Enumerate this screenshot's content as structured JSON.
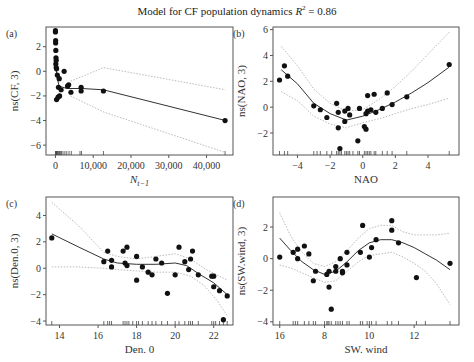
{
  "title": {
    "text": "Model for CF population dynamics",
    "r2_label": "R",
    "r2_sup": "2",
    "r2_value": " = 0.86"
  },
  "chart_data": [
    {
      "panel": "(a)",
      "type": "scatter",
      "xlabel": "N_{t-1}",
      "ylabel": "ns(CF, 3)",
      "xticks": [
        0,
        10000,
        20000,
        30000,
        40000
      ],
      "xtick_labels": [
        "0",
        "10,000",
        "20,000",
        "30,000",
        "40,000"
      ],
      "yticks": [
        2,
        0,
        -2,
        -4,
        -6
      ],
      "xlim": [
        -2500,
        47000
      ],
      "ylim": [
        -6.8,
        3.6
      ],
      "points": [
        [
          0,
          3.3
        ],
        [
          0,
          3.2
        ],
        [
          50,
          2.5
        ],
        [
          50,
          2.3
        ],
        [
          100,
          1.7
        ],
        [
          150,
          1.1
        ],
        [
          200,
          0.9
        ],
        [
          100,
          0.6
        ],
        [
          200,
          0.3
        ],
        [
          300,
          0.2
        ],
        [
          500,
          -0.3
        ],
        [
          2300,
          0
        ],
        [
          1000,
          -0.6
        ],
        [
          800,
          -1.3
        ],
        [
          1500,
          -1.5
        ],
        [
          300,
          -2.3
        ],
        [
          700,
          -2.1
        ],
        [
          1100,
          -2
        ],
        [
          3200,
          -1.2
        ],
        [
          3500,
          -1.1
        ],
        [
          4100,
          -1.7
        ],
        [
          6800,
          -1.3
        ],
        [
          6800,
          -1.6
        ],
        [
          12700,
          -1.6
        ],
        [
          44900,
          -4
        ]
      ],
      "fit": [
        [
          0,
          0.8
        ],
        [
          400,
          -0.5
        ],
        [
          1000,
          -1.2
        ],
        [
          3000,
          -1.4
        ],
        [
          7000,
          -1.4
        ],
        [
          12700,
          -1.5
        ],
        [
          45000,
          -4
        ]
      ],
      "ci_upper": [
        [
          4000,
          -0.8
        ],
        [
          8000,
          -0.3
        ],
        [
          12700,
          0.3
        ],
        [
          45000,
          -1.5
        ]
      ],
      "ci_lower": [
        [
          4000,
          -2
        ],
        [
          8000,
          -2.6
        ],
        [
          12700,
          -3.3
        ],
        [
          45000,
          -6.6
        ]
      ],
      "rug": [
        0,
        100,
        200,
        300,
        400,
        500,
        700,
        900,
        1100,
        1300,
        1600,
        2000,
        2500,
        3000,
        3600,
        4200,
        6500,
        6900,
        12700,
        44900
      ]
    },
    {
      "panel": "(b)",
      "type": "scatter",
      "xlabel": "NAO",
      "ylabel": "ns(NAO, 3)",
      "xticks": [
        -4,
        -2,
        0,
        2,
        4
      ],
      "xtick_labels": [
        "−4",
        "−2",
        "0",
        "2",
        "4"
      ],
      "yticks": [
        6,
        4,
        2,
        0,
        -2
      ],
      "ytick_labels": [
        "6",
        "4",
        "2",
        "0",
        "−2"
      ],
      "xlim": [
        -5.5,
        5.9
      ],
      "ylim": [
        -3.7,
        6.2
      ],
      "points": [
        [
          -5.1,
          2.1
        ],
        [
          -4.8,
          3.2
        ],
        [
          -4.6,
          2.4
        ],
        [
          -3,
          0.1
        ],
        [
          -2.6,
          -0.2
        ],
        [
          -2.2,
          -0.8
        ],
        [
          -1.6,
          0.3
        ],
        [
          -1.5,
          -0.4
        ],
        [
          -1.5,
          -1.6
        ],
        [
          -1.1,
          -1.1
        ],
        [
          -1.1,
          -0.3
        ],
        [
          -0.9,
          -0.1
        ],
        [
          -0.8,
          -0.6
        ],
        [
          -1.4,
          -3.2
        ],
        [
          -0.3,
          -2.6
        ],
        [
          -0.2,
          -0.1
        ],
        [
          0.1,
          -1.5
        ],
        [
          0.2,
          -1.7
        ],
        [
          0.3,
          -0.3
        ],
        [
          0.2,
          -0.5
        ],
        [
          0.3,
          0.9
        ],
        [
          0.5,
          -0.2
        ],
        [
          0.7,
          1
        ],
        [
          0.8,
          -0.4
        ],
        [
          1.2,
          -0.1
        ],
        [
          1.5,
          1.1
        ],
        [
          1.8,
          0.2
        ],
        [
          2.7,
          0.8
        ],
        [
          5.3,
          3.3
        ]
      ],
      "fit": [
        [
          -5,
          2.9
        ],
        [
          -4,
          1.8
        ],
        [
          -3,
          0.3
        ],
        [
          -2,
          -0.5
        ],
        [
          -1,
          -1
        ],
        [
          0,
          -0.7
        ],
        [
          1,
          -0.2
        ],
        [
          2,
          0.4
        ],
        [
          3,
          1.1
        ],
        [
          4,
          1.9
        ],
        [
          5.3,
          3.1
        ]
      ],
      "ci_upper": [
        [
          -5,
          4.7
        ],
        [
          -4,
          3.2
        ],
        [
          -3,
          1.4
        ],
        [
          -2,
          0.3
        ],
        [
          -1,
          -0.3
        ],
        [
          0,
          -0.2
        ],
        [
          1,
          0.6
        ],
        [
          2,
          1.6
        ],
        [
          3,
          2.8
        ],
        [
          4,
          4.1
        ],
        [
          5.3,
          5.8
        ]
      ],
      "ci_lower": [
        [
          -5,
          1.2
        ],
        [
          -4,
          0.5
        ],
        [
          -3,
          -0.7
        ],
        [
          -2,
          -1.3
        ],
        [
          -1,
          -1.6
        ],
        [
          0,
          -1.2
        ],
        [
          1,
          -0.9
        ],
        [
          2,
          -0.5
        ],
        [
          3,
          -0.1
        ],
        [
          4,
          0.2
        ],
        [
          5.3,
          0.7
        ]
      ],
      "rug": [
        -5.1,
        -4.8,
        -4.6,
        -3,
        -2.8,
        -2.6,
        -2.2,
        -1.9,
        -1.6,
        -1.5,
        -1.4,
        -1.3,
        -1.1,
        -1,
        -0.9,
        -0.8,
        -0.6,
        -0.3,
        -0.2,
        0.1,
        0.2,
        0.3,
        0.4,
        0.5,
        0.7,
        0.8,
        1.2,
        1.5,
        1.8,
        2.7,
        5.3
      ]
    },
    {
      "panel": "(c)",
      "type": "scatter",
      "xlabel": "Den. 0",
      "ylabel": "ns(Den.0, 3)",
      "xticks": [
        14,
        16,
        18,
        20,
        22
      ],
      "xtick_labels": [
        "14",
        "16",
        "18",
        "20",
        "22"
      ],
      "yticks": [
        4,
        2,
        0,
        -2,
        -4
      ],
      "ytick_labels": [
        "4",
        "2",
        "0",
        "−2",
        "−4"
      ],
      "xlim": [
        13.3,
        23
      ],
      "ylim": [
        -4.3,
        5.4
      ],
      "points": [
        [
          13.6,
          2.3
        ],
        [
          16.3,
          0.5
        ],
        [
          16.5,
          1.3
        ],
        [
          16.7,
          0.6
        ],
        [
          16.7,
          0.1
        ],
        [
          17.3,
          1.3
        ],
        [
          17.4,
          0.4
        ],
        [
          17.5,
          1.6
        ],
        [
          17.5,
          0.2
        ],
        [
          18,
          0.9
        ],
        [
          18,
          -0.9
        ],
        [
          18.3,
          0.1
        ],
        [
          18.6,
          -0.3
        ],
        [
          18.8,
          -0.5
        ],
        [
          19,
          0.7
        ],
        [
          19.3,
          0.4
        ],
        [
          19.6,
          -1.9
        ],
        [
          20,
          -0.5
        ],
        [
          20.2,
          1.6
        ],
        [
          20.5,
          0.5
        ],
        [
          20.7,
          -0.1
        ],
        [
          20.8,
          0.7
        ],
        [
          20.9,
          1.3
        ],
        [
          21.2,
          -0.5
        ],
        [
          21.9,
          -0.6
        ],
        [
          22,
          -0.6
        ],
        [
          22,
          -1.4
        ],
        [
          22.3,
          -1.7
        ],
        [
          22.5,
          -3.9
        ],
        [
          22.7,
          -2.1
        ]
      ],
      "fit": [
        [
          13.6,
          2.6
        ],
        [
          15,
          1.6
        ],
        [
          16.3,
          0.7
        ],
        [
          17,
          0.4
        ],
        [
          18,
          0.3
        ],
        [
          19,
          0.3
        ],
        [
          20,
          0.4
        ],
        [
          20.6,
          0.2
        ],
        [
          21.2,
          -0.4
        ],
        [
          22,
          -1.1
        ],
        [
          22.7,
          -2
        ]
      ],
      "ci_upper": [
        [
          13.6,
          5
        ],
        [
          15,
          3.2
        ],
        [
          16.3,
          1.2
        ],
        [
          17,
          0.9
        ],
        [
          18,
          0.7
        ],
        [
          19,
          0.9
        ],
        [
          20,
          1.1
        ],
        [
          20.8,
          0.7
        ],
        [
          21.5,
          0
        ],
        [
          22.7,
          -0.9
        ]
      ],
      "ci_lower": [
        [
          13.6,
          0.1
        ],
        [
          15,
          0.1
        ],
        [
          16.3,
          0
        ],
        [
          17,
          -0.1
        ],
        [
          18,
          -0.2
        ],
        [
          19,
          -0.3
        ],
        [
          20,
          -0.3
        ],
        [
          20.8,
          -0.6
        ],
        [
          21.5,
          -1.3
        ],
        [
          22.2,
          -2.5
        ],
        [
          22.7,
          -3.6
        ]
      ],
      "rug": [
        13.6,
        16.3,
        16.5,
        16.6,
        16.7,
        17.3,
        17.4,
        17.5,
        17.6,
        17.8,
        18,
        18.1,
        18.3,
        18.6,
        18.8,
        19,
        19.3,
        19.6,
        20,
        20.2,
        20.5,
        20.7,
        20.8,
        20.9,
        21.2,
        21.9,
        22,
        22.1,
        22.3,
        22.5,
        22.7
      ]
    },
    {
      "panel": "(d)",
      "type": "scatter",
      "xlabel": "SW. wind",
      "ylabel": "ns(SW.wind, 3)",
      "xticks": [
        6,
        8,
        10,
        12
      ],
      "xtick_labels": [
        "16",
        "8",
        "10",
        "12"
      ],
      "yticks": [
        2,
        0,
        -2,
        -4
      ],
      "ytick_labels": [
        "2",
        "0",
        "−2",
        "−4"
      ],
      "xlim": [
        5.7,
        14
      ],
      "ylim": [
        -4.2,
        3.9
      ],
      "points": [
        [
          6,
          0.1
        ],
        [
          6.6,
          0.4
        ],
        [
          6.8,
          0.6
        ],
        [
          6.8,
          0
        ],
        [
          7.1,
          0.8
        ],
        [
          7.3,
          0.3
        ],
        [
          7.5,
          -1.4
        ],
        [
          7.6,
          -0.8
        ],
        [
          8.1,
          -1
        ],
        [
          8.2,
          -0.8
        ],
        [
          8.2,
          -1.8
        ],
        [
          8.3,
          -3.2
        ],
        [
          8.5,
          -0.5
        ],
        [
          8.5,
          -0.8
        ],
        [
          8.7,
          0
        ],
        [
          8.8,
          -0.9
        ],
        [
          8.8,
          -0.8
        ],
        [
          9,
          0.4
        ],
        [
          9,
          -0.4
        ],
        [
          9.6,
          0.4
        ],
        [
          9.7,
          2.1
        ],
        [
          10,
          0.1
        ],
        [
          10.1,
          0.7
        ],
        [
          10.3,
          1.2
        ],
        [
          11,
          2.4
        ],
        [
          11,
          1.8
        ],
        [
          11.3,
          1
        ],
        [
          12.1,
          -1.2
        ],
        [
          13.6,
          -0.3
        ]
      ],
      "fit": [
        [
          6,
          1.3
        ],
        [
          6.5,
          0.5
        ],
        [
          7,
          -0.2
        ],
        [
          7.5,
          -0.7
        ],
        [
          8,
          -1
        ],
        [
          8.5,
          -0.8
        ],
        [
          9,
          -0.2
        ],
        [
          9.5,
          0.5
        ],
        [
          10,
          1
        ],
        [
          10.5,
          1.2
        ],
        [
          11,
          1.2
        ],
        [
          11.5,
          1
        ],
        [
          12,
          0.7
        ],
        [
          12.5,
          0.3
        ],
        [
          13,
          -0.1
        ],
        [
          13.6,
          -0.7
        ]
      ],
      "ci_upper": [
        [
          6,
          2.9
        ],
        [
          6.5,
          1.4
        ],
        [
          7,
          0.4
        ],
        [
          7.5,
          -0.3
        ],
        [
          8,
          -0.5
        ],
        [
          8.5,
          -0.2
        ],
        [
          9,
          0.5
        ],
        [
          9.5,
          1.3
        ],
        [
          10,
          1.9
        ],
        [
          10.5,
          2.1
        ],
        [
          11,
          2.1
        ],
        [
          11.5,
          1.7
        ],
        [
          12,
          1.5
        ],
        [
          12.5,
          1.5
        ],
        [
          13,
          1.5
        ],
        [
          13.6,
          1.6
        ]
      ],
      "ci_lower": [
        [
          6,
          -0.4
        ],
        [
          6.5,
          -0.6
        ],
        [
          7,
          -0.9
        ],
        [
          7.5,
          -1.2
        ],
        [
          8,
          -1.5
        ],
        [
          8.5,
          -1.4
        ],
        [
          9,
          -0.8
        ],
        [
          9.5,
          -0.2
        ],
        [
          10,
          0.2
        ],
        [
          10.5,
          0.3
        ],
        [
          11,
          0.4
        ],
        [
          11.5,
          0.1
        ],
        [
          12,
          -0.3
        ],
        [
          12.5,
          -0.8
        ],
        [
          13,
          -1.6
        ],
        [
          13.6,
          -2.9
        ]
      ],
      "rug": [
        6,
        6.6,
        6.7,
        6.8,
        7.1,
        7.3,
        7.5,
        7.6,
        8,
        8.1,
        8.15,
        8.2,
        8.3,
        8.5,
        8.6,
        8.7,
        8.8,
        9,
        9.1,
        9.6,
        9.7,
        9.9,
        10,
        10.1,
        10.3,
        10.8,
        11,
        11.3,
        12.1,
        12.5,
        13.6
      ]
    }
  ]
}
